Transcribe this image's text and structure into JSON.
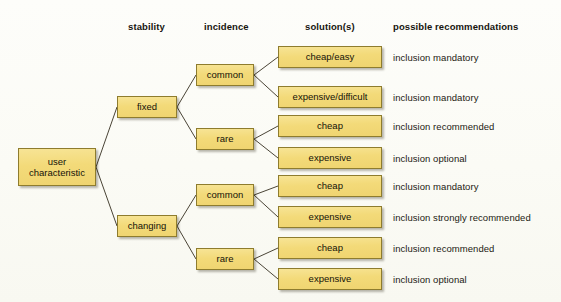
{
  "diagram": {
    "background_color": "#fdfdfa",
    "node_fill_color": "#f3da79",
    "node_border_color": "#8e7c2e",
    "text_color": "#141208"
  },
  "columns": [
    {
      "label": "stability",
      "x": 128,
      "y": 21
    },
    {
      "label": "incidence",
      "x": 204,
      "y": 21
    },
    {
      "label": "solution(s)",
      "x": 305,
      "y": 21
    },
    {
      "label": "possible recommendations",
      "x": 393,
      "y": 21
    }
  ],
  "root": {
    "line1": "user",
    "line2": "characteristic",
    "x": 18,
    "y": 148,
    "w": 78,
    "h": 38
  },
  "stability_nodes": [
    {
      "label": "fixed",
      "x": 117,
      "y": 96,
      "w": 60,
      "h": 22
    },
    {
      "label": "changing",
      "x": 117,
      "y": 215,
      "w": 60,
      "h": 22
    }
  ],
  "incidence_nodes": [
    {
      "label": "common",
      "x": 196,
      "y": 64,
      "w": 58,
      "h": 22,
      "parent": 0
    },
    {
      "label": "rare",
      "x": 196,
      "y": 128,
      "w": 58,
      "h": 22,
      "parent": 0
    },
    {
      "label": "common",
      "x": 196,
      "y": 184,
      "w": 58,
      "h": 22,
      "parent": 1
    },
    {
      "label": "rare",
      "x": 196,
      "y": 248,
      "w": 58,
      "h": 22,
      "parent": 1
    }
  ],
  "rows": [
    {
      "solution": "cheap/easy",
      "recommendation": "inclusion mandatory",
      "box_x": 278,
      "box_y": 46,
      "box_w": 104,
      "box_h": 22,
      "rec_x": 393,
      "rec_y": 52,
      "parent": 0
    },
    {
      "solution": "expensive/difficult",
      "recommendation": "inclusion mandatory",
      "box_x": 278,
      "box_y": 86,
      "box_w": 104,
      "box_h": 22,
      "rec_x": 393,
      "rec_y": 92,
      "parent": 0
    },
    {
      "solution": "cheap",
      "recommendation": "inclusion recommended",
      "box_x": 278,
      "box_y": 115,
      "box_w": 104,
      "box_h": 22,
      "rec_x": 393,
      "rec_y": 121,
      "parent": 1
    },
    {
      "solution": "expensive",
      "recommendation": "inclusion optional",
      "box_x": 278,
      "box_y": 147,
      "box_w": 104,
      "box_h": 22,
      "rec_x": 393,
      "rec_y": 153,
      "parent": 1
    },
    {
      "solution": "cheap",
      "recommendation": "inclusion mandatory",
      "box_x": 278,
      "box_y": 175,
      "box_w": 104,
      "box_h": 22,
      "rec_x": 393,
      "rec_y": 181,
      "parent": 2
    },
    {
      "solution": "expensive",
      "recommendation": "inclusion strongly recommended",
      "box_x": 278,
      "box_y": 206,
      "box_w": 104,
      "box_h": 22,
      "rec_x": 393,
      "rec_y": 212,
      "parent": 2
    },
    {
      "solution": "cheap",
      "recommendation": "inclusion recommended",
      "box_x": 278,
      "box_y": 237,
      "box_w": 104,
      "box_h": 22,
      "rec_x": 393,
      "rec_y": 243,
      "parent": 3
    },
    {
      "solution": "expensive",
      "recommendation": "inclusion optional",
      "box_x": 278,
      "box_y": 268,
      "box_w": 104,
      "box_h": 22,
      "rec_x": 393,
      "rec_y": 274,
      "parent": 3
    }
  ],
  "connector": {
    "color": "#4a4436",
    "width": 1
  }
}
